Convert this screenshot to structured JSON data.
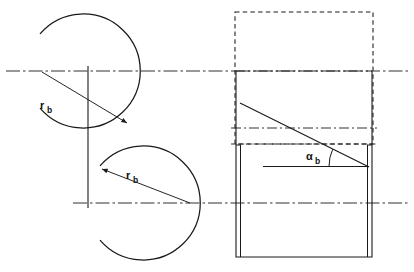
{
  "figure": {
    "background_color": "#ffffff",
    "line_color": "#1a1a1a",
    "width": 414,
    "height": 272
  },
  "labels": {
    "radius_upper": {
      "symbol": "r",
      "subscript": "b",
      "text": "rb"
    },
    "radius_lower": {
      "symbol": "r",
      "subscript": "b",
      "text": "rb"
    },
    "angle": {
      "symbol": "α",
      "subscript": "b",
      "text": "αb"
    }
  },
  "geometry": {
    "centerline_upper": {
      "y": 71,
      "x_start": 6,
      "x_end": 408,
      "style": "dash-dot"
    },
    "centerline_lower": {
      "y": 203,
      "x_start": 73,
      "x_end": 408,
      "style": "dash-dot"
    },
    "circle_upper": {
      "cx": 88,
      "cy": 71,
      "r": 57,
      "style": "solid-arc",
      "gap_deg": 28
    },
    "circle_lower": {
      "cx": 148,
      "cy": 203,
      "r": 57,
      "style": "solid-arc",
      "gap_deg": 28
    },
    "tangent_line": {
      "x": 88,
      "y_start": 71,
      "y_end": 203,
      "style": "solid"
    },
    "radius_arrow_upper": {
      "x1": 42,
      "y1": 71,
      "x2": 128,
      "y2": 124
    },
    "radius_arrow_lower": {
      "x1": 101,
      "y1": 168,
      "x2": 190,
      "y2": 203
    },
    "dashed_rect_top": {
      "x": 235,
      "y": 12,
      "w": 138,
      "h": 132,
      "style": "dashed"
    },
    "solid_rect_body": {
      "x": 236,
      "y": 71,
      "w": 136,
      "h": 186,
      "style": "solid"
    },
    "inner_line_left": {
      "x": 240,
      "y_start": 145,
      "y_end": 257,
      "style": "solid"
    },
    "inner_line_right": {
      "x": 368,
      "y_start": 145,
      "y_end": 257,
      "style": "solid"
    },
    "dashdot_line_mid": {
      "y": 128,
      "x_start": 231,
      "x_end": 377,
      "style": "dash-dot"
    },
    "dashed_line_mid": {
      "y": 144,
      "x_start": 231,
      "x_end": 377,
      "style": "dashed"
    },
    "helix_line": {
      "x1": 240,
      "y1": 103,
      "x2": 368,
      "y2": 166,
      "style": "solid"
    },
    "reference_line": {
      "x1": 264,
      "y1": 166,
      "x2": 368,
      "y2": 166,
      "style": "solid"
    },
    "angle_arc": {
      "cx": 368,
      "cy": 166,
      "r": 40,
      "start_deg": 180,
      "end_deg": 206
    }
  },
  "label_positions": {
    "radius_upper": {
      "x": 40,
      "y": 108
    },
    "radius_lower": {
      "x": 126,
      "y": 178
    },
    "angle": {
      "x": 308,
      "y": 160
    }
  }
}
